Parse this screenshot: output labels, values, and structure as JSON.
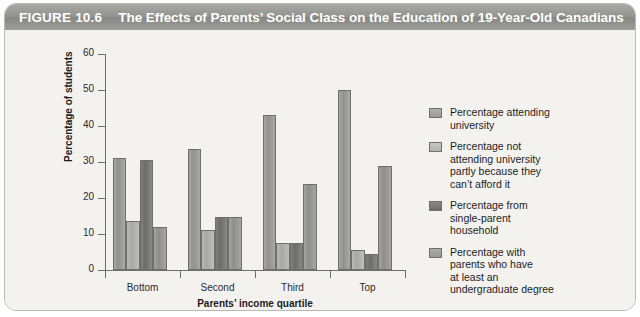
{
  "figure": {
    "number": "FIGURE 10.6",
    "title": "The Effects of Parents’ Social Class on the Education of 19-Year-Old Canadians"
  },
  "chart_data": {
    "type": "bar",
    "title": "The Effects of Parents’ Social Class on the Education of 19-Year-Old Canadians",
    "xlabel": "Parents’ income quartile",
    "ylabel": "Percentage of students",
    "categories": [
      "Bottom",
      "Second",
      "Third",
      "Top"
    ],
    "ylim": [
      0,
      60
    ],
    "yticks": [
      0,
      10,
      20,
      30,
      40,
      50,
      60
    ],
    "grid": false,
    "legend_position": "right",
    "series": [
      {
        "name": "Percentage attending\nuniversity",
        "color": "#9a9a97",
        "values": [
          31,
          33.5,
          43,
          50
        ]
      },
      {
        "name": "Percentage not\nattending university\npartly because they\ncan’t afford it",
        "color": "#b8b8b5",
        "values": [
          13.5,
          11,
          7.5,
          5.5
        ]
      },
      {
        "name": "Percentage from\nsingle-parent\nhousehold",
        "color": "#6f6f6d",
        "values": [
          30.5,
          14.8,
          7.5,
          4.5
        ]
      },
      {
        "name": "Percentage with\nparents who have\nat least an\nundergraduate degree",
        "color": "#9c9c99",
        "values": [
          12,
          14.8,
          24,
          29
        ]
      }
    ]
  }
}
